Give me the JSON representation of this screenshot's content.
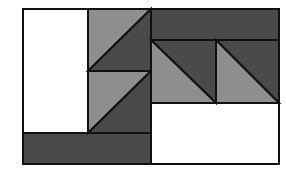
{
  "diagram": {
    "colors": {
      "white": "#ffffff",
      "light": "#8e8e8e",
      "dark": "#4a4a4a",
      "stroke": "#111111"
    },
    "frame": {
      "x": 23,
      "y": 9,
      "w": 256,
      "h": 155
    },
    "rects": [
      {
        "name": "left-white-column",
        "x": 23,
        "y": 9,
        "w": 65,
        "h": 124,
        "fill": "white"
      },
      {
        "name": "top-right-dark-bar",
        "x": 151,
        "y": 9,
        "w": 128,
        "h": 31,
        "fill": "dark"
      },
      {
        "name": "bottom-left-dark-bar",
        "x": 23,
        "y": 133,
        "w": 128,
        "h": 31,
        "fill": "dark"
      },
      {
        "name": "bottom-right-white",
        "x": 151,
        "y": 103,
        "w": 128,
        "h": 61,
        "fill": "white"
      }
    ],
    "triangles": [
      {
        "name": "tri-upper-light",
        "points": "88,9 151,9 88,71",
        "fill": "light"
      },
      {
        "name": "tri-upper-dark",
        "points": "151,9 151,71 88,71",
        "fill": "dark"
      },
      {
        "name": "tri-lower-light",
        "points": "88,71 151,71 88,133",
        "fill": "light"
      },
      {
        "name": "tri-lower-dark",
        "points": "151,71 151,133 88,133",
        "fill": "dark"
      },
      {
        "name": "tri-right1-dark",
        "points": "151,40 216,40 216,103",
        "fill": "dark"
      },
      {
        "name": "tri-right1-light",
        "points": "151,40 216,103 151,103",
        "fill": "light"
      },
      {
        "name": "tri-right2-dark",
        "points": "216,40 279,40 279,103",
        "fill": "dark"
      },
      {
        "name": "tri-right2-light",
        "points": "216,40 279,103 216,103",
        "fill": "light"
      }
    ]
  }
}
